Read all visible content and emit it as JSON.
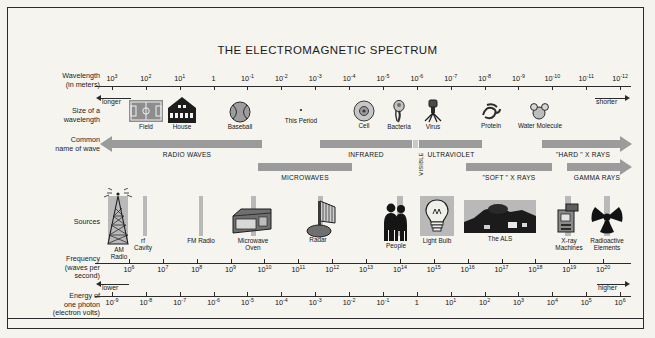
{
  "poster": {
    "title": "THE ELECTROMAGNETIC SPECTRUM",
    "background_color": "#f4f3ee",
    "band_color": "#9b9b9b",
    "plate_color": "#b9b9b9",
    "ink_color": "#1b1b1b"
  },
  "row_labels": {
    "wavelength": "Wavelength\n(in meters)",
    "wavelength_l1": "Wavelength",
    "wavelength_l2": "(in meters)",
    "size_l1": "Size of a",
    "size_l2": "wavelength",
    "common_l1": "Common",
    "common_l2": "name of wave",
    "sources": "Sources",
    "frequency_l1": "Frequency",
    "frequency_l2": "(waves per",
    "frequency_l3": "second)",
    "energy_l1": "Energy of",
    "energy_l2": "one photon",
    "energy_l3": "(electron volts)"
  },
  "axes": {
    "wavelength": {
      "name": "wavelength-axis",
      "unit": "meters",
      "ticks": [
        "10^3",
        "10^2",
        "10^1",
        "1",
        "10^-1",
        "10^-2",
        "10^-3",
        "10^-4",
        "10^-5",
        "10^-6",
        "10^-7",
        "10^-8",
        "10^-9",
        "10^-10",
        "10^-11",
        "10^-12"
      ],
      "tick_bases": [
        "10",
        "10",
        "10",
        "1",
        "10",
        "10",
        "10",
        "10",
        "10",
        "10",
        "10",
        "10",
        "10",
        "10",
        "10",
        "10"
      ],
      "tick_exps": [
        "3",
        "2",
        "1",
        "",
        "-1",
        "-2",
        "-3",
        "-4",
        "-5",
        "-6",
        "-7",
        "-8",
        "-9",
        "-10",
        "-11",
        "-12"
      ],
      "left_direction_label": "longer",
      "right_direction_label": "shorter"
    },
    "frequency": {
      "name": "frequency-axis",
      "unit": "waves per second",
      "tick_bases": [
        "10",
        "10",
        "10",
        "10",
        "10",
        "10",
        "10",
        "10",
        "10",
        "10",
        "10",
        "10",
        "10",
        "10",
        "10"
      ],
      "tick_exps": [
        "6",
        "7",
        "8",
        "9",
        "10",
        "11",
        "12",
        "13",
        "14",
        "15",
        "16",
        "17",
        "18",
        "19",
        "20"
      ]
    },
    "energy": {
      "name": "energy-axis",
      "unit": "electron volts",
      "tick_bases": [
        "10",
        "10",
        "10",
        "10",
        "10",
        "10",
        "10",
        "10",
        "10",
        "1",
        "10",
        "10",
        "10",
        "10",
        "10",
        "10"
      ],
      "tick_exps": [
        "-9",
        "-8",
        "-7",
        "-6",
        "-5",
        "-4",
        "-3",
        "-2",
        "-1",
        "",
        "1",
        "2",
        "3",
        "4",
        "5",
        "6"
      ],
      "left_direction_label": "lower",
      "right_direction_label": "higher"
    }
  },
  "size_examples": [
    {
      "name": "field",
      "label": "Field"
    },
    {
      "name": "house",
      "label": "House"
    },
    {
      "name": "baseball",
      "label": "Baseball"
    },
    {
      "name": "this-period",
      "label": "This Period"
    },
    {
      "name": "cell",
      "label": "Cell"
    },
    {
      "name": "bacteria",
      "label": "Bacteria"
    },
    {
      "name": "virus",
      "label": "Virus"
    },
    {
      "name": "protein",
      "label": "Protein"
    },
    {
      "name": "water-molecule",
      "label": "Water Molecule"
    }
  ],
  "wave_bands": [
    {
      "name": "radio-waves",
      "label": "RADIO WAVES"
    },
    {
      "name": "microwaves",
      "label": "MICROWAVES"
    },
    {
      "name": "infrared",
      "label": "INFRARED"
    },
    {
      "name": "visible",
      "label": "VISIBLE"
    },
    {
      "name": "ultraviolet",
      "label": "ULTRAVIOLET"
    },
    {
      "name": "soft-x-rays",
      "label": "\"SOFT \" X RAYS"
    },
    {
      "name": "hard-x-rays",
      "label": "\"HARD \" X RAYS"
    },
    {
      "name": "gamma-rays",
      "label": "GAMMA RAYS"
    }
  ],
  "sources": [
    {
      "name": "am-radio",
      "label_l1": "AM",
      "label_l2": "Radio"
    },
    {
      "name": "rf-cavity",
      "label_l1": "rf",
      "label_l2": "Cavity"
    },
    {
      "name": "fm-radio",
      "label_l1": "FM Radio",
      "label_l2": ""
    },
    {
      "name": "microwave-oven",
      "label_l1": "Microwave",
      "label_l2": "Oven"
    },
    {
      "name": "radar",
      "label_l1": "Radar",
      "label_l2": ""
    },
    {
      "name": "people",
      "label_l1": "People",
      "label_l2": ""
    },
    {
      "name": "light-bulb",
      "label_l1": "Light Bulb",
      "label_l2": ""
    },
    {
      "name": "the-als",
      "label_l1": "The ALS",
      "label_l2": ""
    },
    {
      "name": "x-ray-machines",
      "label_l1": "X-ray",
      "label_l2": "Machines"
    },
    {
      "name": "radioactive-elements",
      "label_l1": "Radioactive",
      "label_l2": "Elements"
    }
  ]
}
